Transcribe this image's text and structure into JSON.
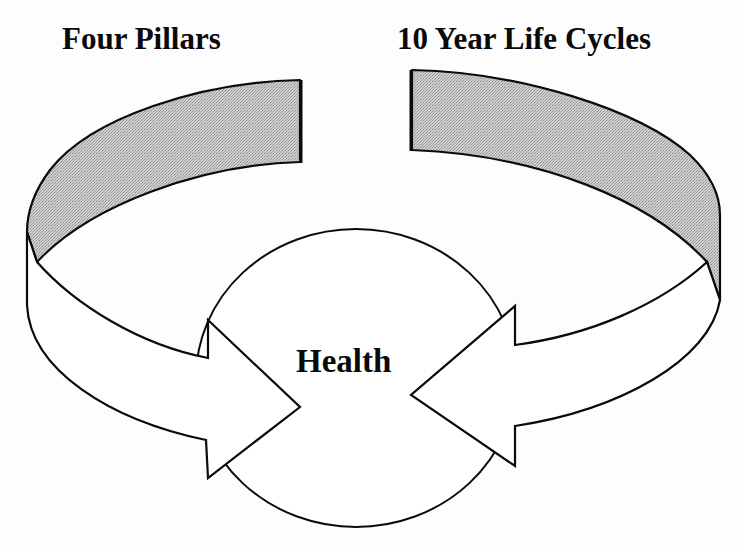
{
  "diagram": {
    "title_left": "Four Pillars",
    "title_right": "10 Year Life Cycles",
    "center_label": "Health",
    "colors": {
      "background": "#fdfdfd",
      "stroke": "#0a0a0a",
      "shaded_band": "#c4c4c4",
      "arrow_fill": "#ffffff",
      "circle_fill": "#ffffff"
    },
    "elements": [
      {
        "type": "curved-arrow",
        "name": "left-arrow",
        "source_label": "Four Pillars",
        "points_to": "Health"
      },
      {
        "type": "curved-arrow",
        "name": "right-arrow",
        "source_label": "10 Year Life Cycles",
        "points_to": "Health"
      },
      {
        "type": "circle",
        "name": "center-circle",
        "label": "Health"
      }
    ]
  }
}
